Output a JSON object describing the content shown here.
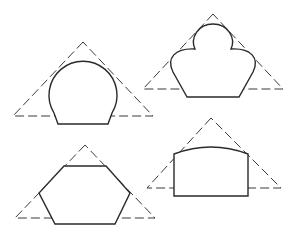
{
  "figure": {
    "panels": [
      {
        "name": "circle-truncated",
        "position": "top-left"
      },
      {
        "name": "trefoil-clover",
        "position": "top-right"
      },
      {
        "name": "hexagon",
        "position": "bottom-left"
      },
      {
        "name": "arched-rectangle",
        "position": "bottom-right"
      }
    ],
    "colors": {
      "line": "#2a2a2a",
      "dashed": "#3a3a3a",
      "background": "#ffffff"
    }
  }
}
